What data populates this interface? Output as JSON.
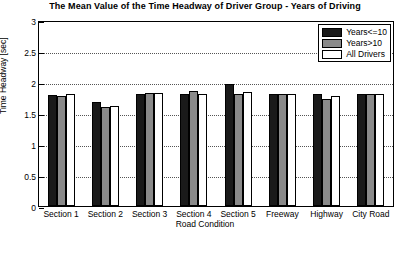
{
  "chart_data": {
    "type": "bar",
    "title": "The Mean Value of the Time Headway of Driver Group - Years of Driving",
    "xlabel": "Road Condition",
    "ylabel": "Time Headway [sec]",
    "categories": [
      "Section 1",
      "Section 2",
      "Section 3",
      "Section 4",
      "Section 5",
      "Freeway",
      "Highway",
      "City Road"
    ],
    "series": [
      {
        "name": "Years<=10",
        "color": "#1a1a1a",
        "values": [
          1.79,
          1.68,
          1.8,
          1.81,
          1.97,
          1.8,
          1.8,
          1.8
        ]
      },
      {
        "name": "Years>10",
        "color": "#8a8a8a",
        "values": [
          1.77,
          1.6,
          1.83,
          1.86,
          1.8,
          1.8,
          1.72,
          1.81
        ]
      },
      {
        "name": "All Drivers",
        "color": "#ffffff",
        "values": [
          1.8,
          1.62,
          1.83,
          1.81,
          1.84,
          1.8,
          1.77,
          1.8
        ]
      }
    ],
    "ylim": [
      0,
      3
    ],
    "yticks": [
      0,
      0.5,
      1,
      1.5,
      2,
      2.5,
      3
    ],
    "ytick_labels": [
      "0",
      "0.5",
      "1",
      "1.5",
      "2",
      "2.5",
      "3"
    ],
    "grid": true,
    "legend_position": "top-right"
  }
}
